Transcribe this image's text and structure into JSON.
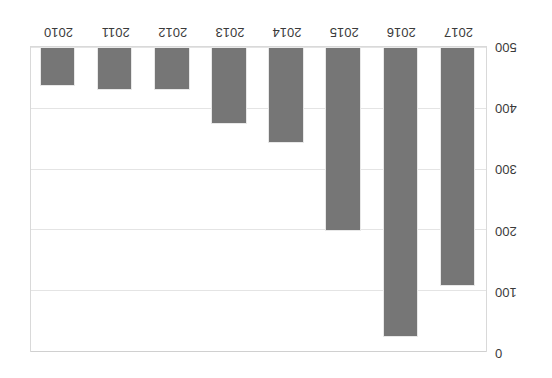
{
  "chart": {
    "type": "bar",
    "title": "",
    "xlabel": "",
    "ylabel": "",
    "orientation_note": "rendered upside-down (rotated 180 degrees)",
    "grid": "horizontal",
    "legend": "none",
    "bar_color": "#767676",
    "gridline_color": "#e4e4e4",
    "frame_color": "#d9d9d9",
    "background": "#ffffff"
  },
  "chart_data": {
    "type": "bar",
    "title": "",
    "xlabel": "",
    "ylabel": "",
    "categories": [
      "2017",
      "2016",
      "2015",
      "2014",
      "2013",
      "2012",
      "2011",
      "2010"
    ],
    "values": [
      390,
      474,
      300,
      157,
      126,
      70,
      70,
      64
    ],
    "ylim": [
      0,
      500
    ],
    "yticks": [
      "0",
      "100",
      "200",
      "300",
      "400",
      "500"
    ],
    "ytick_values": [
      0,
      100,
      200,
      300,
      400,
      500
    ],
    "grid": true,
    "legend_position": "none",
    "series": [
      {
        "name": "",
        "values": [
          390,
          474,
          300,
          157,
          126,
          70,
          70,
          64
        ]
      }
    ]
  },
  "axis": {
    "y_labels": [
      "0",
      "100",
      "200",
      "300",
      "400",
      "500"
    ],
    "x_labels": [
      "2017",
      "2016",
      "2015",
      "2014",
      "2013",
      "2012",
      "2011",
      "2010"
    ]
  }
}
